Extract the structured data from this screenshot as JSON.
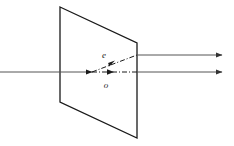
{
  "figure": {
    "background_color": "#ffffff",
    "stroke_color": "#1a1a1a",
    "width": 234,
    "height": 146
  },
  "crystal": {
    "name": "birefringent-crystal-plate",
    "shape": "parallelogram",
    "stroke_color": "#1a1a1a",
    "stroke_width": 1.3,
    "fill": "none",
    "vertices": [
      {
        "x": 60,
        "y": 7
      },
      {
        "x": 137,
        "y": 43
      },
      {
        "x": 137,
        "y": 138
      },
      {
        "x": 60,
        "y": 102
      }
    ]
  },
  "rays": {
    "incident": {
      "label": "incident-ray",
      "style": "solid",
      "x1": 0,
      "y1": 72,
      "x2": 92,
      "y2": 72,
      "stroke_color": "#555555",
      "stroke_width": 1
    },
    "ordinary_internal": {
      "label": "ordinary-ray-internal",
      "symbol": "o",
      "style": "dash-dot",
      "x1": 92,
      "y1": 72,
      "x2": 137,
      "y2": 72,
      "stroke_color": "#1a1a1a",
      "stroke_width": 1,
      "arrow_at": {
        "x": 113,
        "y": 72
      }
    },
    "extraordinary_internal": {
      "label": "extraordinary-ray-internal",
      "symbol": "e",
      "style": "dash-dot",
      "x1": 92,
      "y1": 72,
      "x2": 137,
      "y2": 55,
      "stroke_color": "#1a1a1a",
      "stroke_width": 1,
      "arrow_at": {
        "x": 114,
        "y": 63.6
      }
    },
    "extraordinary_exit": {
      "label": "extraordinary-ray-exit",
      "style": "solid",
      "x1": 137,
      "y1": 55,
      "x2": 228,
      "y2": 55,
      "stroke_color": "#555555",
      "stroke_width": 1,
      "arrow_at": {
        "x": 228,
        "y": 55
      }
    },
    "ordinary_exit": {
      "label": "ordinary-ray-exit",
      "style": "solid",
      "x1": 137,
      "y1": 72,
      "x2": 228,
      "y2": 72,
      "stroke_color": "#555555",
      "stroke_width": 1,
      "arrow_at": {
        "x": 228,
        "y": 72
      }
    }
  },
  "labels": {
    "extraordinary": {
      "text": "e",
      "x": 104,
      "y": 58,
      "description": "extraordinary ray label"
    },
    "ordinary": {
      "text": "o",
      "x": 106,
      "y": 88,
      "description": "ordinary ray label"
    }
  },
  "watermark": {
    "text": "",
    "x": 150,
    "y": 136,
    "color": "#f4f4f4",
    "visible": false
  }
}
